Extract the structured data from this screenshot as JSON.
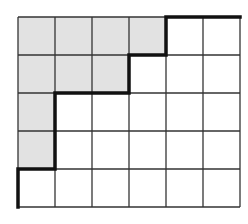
{
  "grid": {
    "cols": 6,
    "rows": 5,
    "origin": [
      18,
      17
    ],
    "cell_width": 37,
    "cell_height": 38,
    "shaded_fill": "#e2e2e2",
    "line_color": "#333333",
    "path_color": "#111111",
    "shaded_cells": [
      [
        0,
        0
      ],
      [
        0,
        1
      ],
      [
        0,
        2
      ],
      [
        0,
        3
      ],
      [
        1,
        0
      ],
      [
        1,
        1
      ],
      [
        1,
        2
      ],
      [
        2,
        0
      ],
      [
        3,
        0
      ]
    ],
    "staircase_path": [
      [
        0,
        5
      ],
      [
        0,
        4
      ],
      [
        1,
        4
      ],
      [
        1,
        2
      ],
      [
        3,
        2
      ],
      [
        3,
        1
      ],
      [
        4,
        1
      ],
      [
        4,
        0
      ],
      [
        6,
        0
      ]
    ]
  }
}
